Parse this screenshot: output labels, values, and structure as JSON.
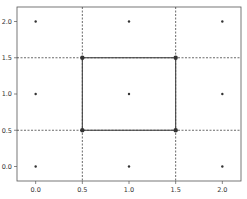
{
  "chart_data": {
    "type": "scatter",
    "title": "",
    "xlabel": "",
    "ylabel": "",
    "xlim": [
      -0.2,
      2.2
    ],
    "ylim": [
      -0.2,
      2.2
    ],
    "grid": false,
    "x_ticks": [
      "0.0",
      "0.5",
      "1.0",
      "1.5",
      "2.0"
    ],
    "y_ticks": [
      "0.0",
      "0.5",
      "1.0",
      "1.5",
      "2.0"
    ],
    "points": [
      {
        "x": 0.0,
        "y": 0.0
      },
      {
        "x": 1.0,
        "y": 0.0
      },
      {
        "x": 2.0,
        "y": 0.0
      },
      {
        "x": 0.0,
        "y": 1.0
      },
      {
        "x": 1.0,
        "y": 1.0
      },
      {
        "x": 2.0,
        "y": 1.0
      },
      {
        "x": 0.0,
        "y": 2.0
      },
      {
        "x": 1.0,
        "y": 2.0
      },
      {
        "x": 2.0,
        "y": 2.0
      }
    ],
    "vertices": [
      {
        "x": 0.5,
        "y": 0.5
      },
      {
        "x": 1.5,
        "y": 0.5
      },
      {
        "x": 1.5,
        "y": 1.5
      },
      {
        "x": 0.5,
        "y": 1.5
      }
    ],
    "dashed_lines": {
      "vertical": [
        0.5,
        1.5
      ],
      "horizontal": [
        0.5,
        1.5
      ]
    },
    "solid_square": {
      "x0": 0.5,
      "y0": 0.5,
      "x1": 1.5,
      "y1": 1.5
    },
    "colors": {
      "points": "#333333",
      "lines": "#444444",
      "axes": "#555555"
    }
  }
}
